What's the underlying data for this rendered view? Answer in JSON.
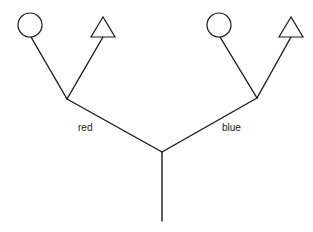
{
  "diagram": {
    "type": "tree",
    "root": {
      "x": 162,
      "y": 221
    },
    "center_junction": {
      "x": 162,
      "y": 152
    },
    "branches": [
      {
        "label": "red",
        "junction": {
          "x": 67,
          "y": 99
        },
        "label_pos": {
          "x": 78,
          "y": 131
        },
        "leaves": [
          {
            "shape": "circle",
            "cx": 30,
            "cy": 25,
            "r": 12
          },
          {
            "shape": "triangle",
            "points": "103,17 91,37 115,37",
            "attach": {
              "x": 103,
              "y": 37
            }
          }
        ]
      },
      {
        "label": "blue",
        "junction": {
          "x": 257,
          "y": 98
        },
        "label_pos": {
          "x": 222,
          "y": 131
        },
        "leaves": [
          {
            "shape": "circle",
            "cx": 219,
            "cy": 25,
            "r": 12
          },
          {
            "shape": "triangle",
            "points": "291,17 279,37 303,37",
            "attach": {
              "x": 291,
              "y": 37
            }
          }
        ]
      }
    ],
    "colors": {
      "stroke": "#1a1a1a",
      "background": "#ffffff"
    }
  }
}
